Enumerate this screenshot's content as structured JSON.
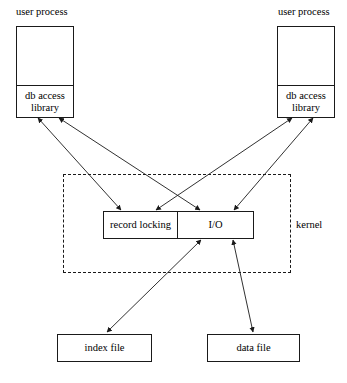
{
  "diagram": {
    "background_color": "#ffffff",
    "line_color": "#1a1a1a",
    "nodes": {
      "user_process_left": {
        "label": "user process",
        "sub_label": "db access\nlibrary",
        "caption": "user process"
      },
      "user_process_right": {
        "label": "user process",
        "sub_label": "db access\nlibrary",
        "caption": "user process"
      },
      "record_locking": {
        "label": "record locking"
      },
      "io": {
        "label": "I/O"
      },
      "index_file": {
        "label": "index file"
      },
      "data_file": {
        "label": "data file"
      }
    },
    "regions": {
      "kernel": {
        "label": "kernel"
      }
    },
    "edges": [
      {
        "id": "left-lib-to-record-locking",
        "from": "db access library (left)",
        "to": "record locking",
        "arrowheads": "both"
      },
      {
        "id": "left-lib-to-io",
        "from": "db access library (left)",
        "to": "I/O",
        "arrowheads": "both"
      },
      {
        "id": "right-lib-to-record-locking",
        "from": "db access library (right)",
        "to": "record locking",
        "arrowheads": "both"
      },
      {
        "id": "right-lib-to-io",
        "from": "db access library (right)",
        "to": "I/O",
        "arrowheads": "both"
      },
      {
        "id": "io-to-index-file",
        "from": "I/O",
        "to": "index file",
        "arrowheads": "both"
      },
      {
        "id": "io-to-data-file",
        "from": "I/O",
        "to": "data file",
        "arrowheads": "both"
      }
    ]
  }
}
